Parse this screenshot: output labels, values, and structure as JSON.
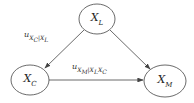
{
  "nodes": [
    {
      "id": "XL",
      "base": "X",
      "sub": "L",
      "cx": 97,
      "cy": 19
    },
    {
      "id": "XC",
      "base": "X",
      "sub": "C",
      "cx": 30,
      "cy": 80
    },
    {
      "id": "XM",
      "base": "X",
      "sub": "M",
      "cx": 165,
      "cy": 81
    }
  ],
  "edges": [
    {
      "from": "XL",
      "to": "XC",
      "label_base": "u",
      "label_sub": "X",
      "label_sub2": "C",
      "label_rest": "|X",
      "label_sub3": "L"
    },
    {
      "from": "XL",
      "to": "XM"
    },
    {
      "from": "XC",
      "to": "XM",
      "label_base": "u",
      "label_sub": "X",
      "label_sub2": "M",
      "label_rest": "|X",
      "label_sub3": "L",
      "label_rest2": "X",
      "label_sub4": "C"
    }
  ],
  "colors": {
    "stroke": "#444444",
    "text": "#222222"
  }
}
